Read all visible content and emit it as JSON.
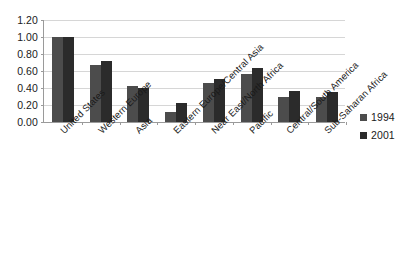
{
  "chart_data": {
    "type": "bar",
    "title": "",
    "subtitle": "",
    "xlabel": "",
    "ylabel": "",
    "ylim": [
      0,
      1.2
    ],
    "ytick_step": 0.2,
    "ytick_labels": [
      "0.00",
      "0.20",
      "0.40",
      "0.60",
      "0.80",
      "1.00",
      "1.20"
    ],
    "ytick_values": [
      0,
      0.2,
      0.4,
      0.6,
      0.8,
      1.0,
      1.2
    ],
    "grid": true,
    "legend_position": "right",
    "categories": [
      "United States",
      "Western Europe",
      "Asia",
      "Eastern Europe/Central Asia",
      "Near East/North Africa",
      "Pacific",
      "Central/South America",
      "Sub-Saharan Africa"
    ],
    "series": [
      {
        "name": "1994",
        "color": "#4c4c4c",
        "values": [
          1.0,
          0.67,
          0.42,
          0.12,
          0.46,
          0.57,
          0.3,
          0.29
        ]
      },
      {
        "name": "2001",
        "color": "#2b2b2b",
        "values": [
          1.0,
          0.72,
          0.4,
          0.22,
          0.51,
          0.63,
          0.36,
          0.35
        ]
      }
    ]
  },
  "legend": {
    "entries": [
      {
        "label": "1994",
        "color": "#4c4c4c"
      },
      {
        "label": "2001",
        "color": "#2b2b2b"
      }
    ]
  },
  "colors": {
    "series_1994": "#4c4c4c",
    "series_2001": "#2b2b2b",
    "gridline": "#d6d6d6",
    "axis": "#9a9a9a",
    "background": "#ffffff",
    "text": "#1a1a1a"
  }
}
